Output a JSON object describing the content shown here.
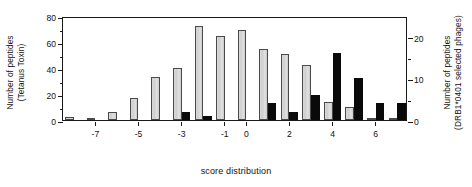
{
  "chart_data": {
    "type": "bar",
    "title": "",
    "xlabel": "score distribution",
    "ylabel_left": "Number of peptides\n(Tetanus Toxin)",
    "ylabel_left_line1": "Number of peptides",
    "ylabel_left_line2": "(Tetanus Toxin)",
    "ylabel_right_line1": "Number of peptides",
    "ylabel_right_line2": "(DRB1*0401 selected phages)",
    "grid": false,
    "legend": "none",
    "ylim_left": [
      0,
      80
    ],
    "ylim_right": [
      0,
      25
    ],
    "yticks_left": [
      "0",
      "20",
      "40",
      "60",
      "80"
    ],
    "yticks_left_values": [
      0,
      20,
      40,
      60,
      80
    ],
    "yticks_right": [
      "0",
      "10",
      "20"
    ],
    "yticks_right_values": [
      0,
      10,
      20
    ],
    "xticks": [
      "-7",
      "-5",
      "-3",
      "-1",
      "0",
      "2",
      "4",
      "6"
    ],
    "xticks_values": [
      -7,
      -5,
      -3,
      -1,
      0,
      2,
      4,
      6
    ],
    "categories": [
      -8,
      -7,
      -6,
      -5,
      -4,
      -3,
      -2,
      -1,
      0,
      1,
      2,
      3,
      4,
      5,
      6,
      7
    ],
    "series": [
      {
        "name": "Tetanus Toxin",
        "color": "#d4d4d4",
        "axis": "left",
        "values": [
          2,
          1,
          6,
          17,
          33,
          40,
          72,
          65,
          69,
          55,
          51,
          42,
          14,
          10,
          1,
          1
        ]
      },
      {
        "name": "DRB1*0401 selected phages",
        "color": "#0a0a0a",
        "axis": "right",
        "values": [
          0,
          0,
          0,
          0,
          0,
          2,
          1,
          0,
          0,
          4,
          2,
          6,
          16,
          10,
          4,
          4
        ]
      }
    ]
  },
  "caption_sliver": ""
}
